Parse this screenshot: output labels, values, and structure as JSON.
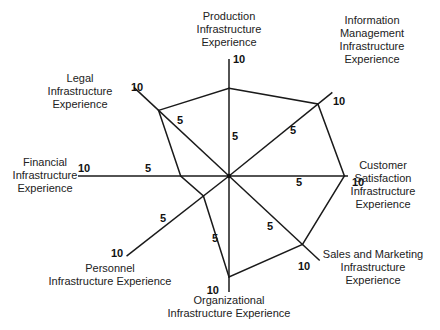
{
  "chart_data": {
    "type": "radar",
    "title": "",
    "scale_max": 10,
    "tick_labels": [
      "5",
      "10"
    ],
    "axes": [
      {
        "name": "Production Infrastructure Experience",
        "lines": [
          "Production",
          "Infrastructure",
          "Experience"
        ],
        "value": 7.5
      },
      {
        "name": "Information Management Infrastructure Experience",
        "lines": [
          "Information",
          "Management",
          "Infrastructure",
          "Experience"
        ],
        "value": 8.6
      },
      {
        "name": "Customer Satisfaction Infrastructure Experience",
        "lines": [
          "Customer",
          "Satisfaction",
          "Infrastructure",
          "Experience"
        ],
        "value": 9.7
      },
      {
        "name": "Sales and Marketing Infrastructure Experience",
        "lines": [
          "Sales and Marketing",
          "Infrastructure",
          "Experience"
        ],
        "value": 8.1
      },
      {
        "name": "Organizational Infrastructure Experience",
        "lines": [
          "Organizational",
          "Infrastructure Experience"
        ],
        "value": 8.7
      },
      {
        "name": "Personnel Infrastructure Experience",
        "lines": [
          "Personnel",
          "Infrastructure Experience"
        ],
        "value": 2.5
      },
      {
        "name": "Financial Infrastructure Experience",
        "lines": [
          "Financial",
          "Infrastructure",
          "Experience"
        ],
        "value": 3.2
      },
      {
        "name": "Legal Infrastructure Experience",
        "lines": [
          "Legal",
          "Infrastructure",
          "Experience"
        ],
        "value": 7.4
      }
    ]
  }
}
